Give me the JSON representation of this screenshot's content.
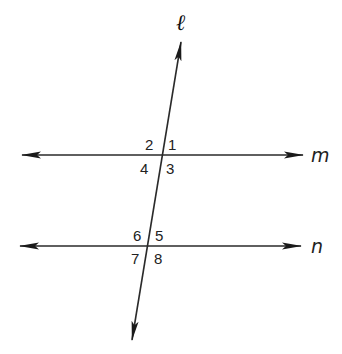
{
  "diagram": {
    "type": "parallel lines cut by a transversal",
    "colors": {
      "line": "#2a2a2a",
      "text": "#222222",
      "background": "#ffffff"
    },
    "lines": {
      "transversal": {
        "label": "ℓ"
      },
      "m": {
        "label": "m"
      },
      "n": {
        "label": "n"
      }
    },
    "angles": {
      "a1": "1",
      "a2": "2",
      "a3": "3",
      "a4": "4",
      "a5": "5",
      "a6": "6",
      "a7": "7",
      "a8": "8"
    }
  }
}
